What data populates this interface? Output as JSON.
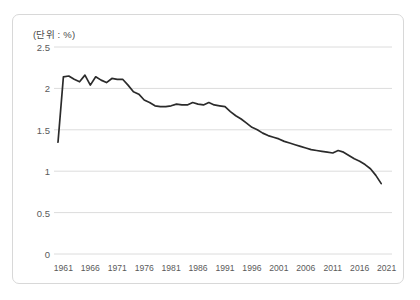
{
  "chart_data": {
    "type": "line",
    "title": "",
    "subtitle": "",
    "unit_label": "(단위 : %)",
    "xlabel": "",
    "ylabel": "",
    "xlim": [
      1960,
      2022
    ],
    "ylim": [
      0,
      2.5
    ],
    "grid": true,
    "legend_position": "none",
    "line_color": "#2b2b2b",
    "grid_color": "#dcdcdc",
    "frame_color": "#d8d8d8",
    "text_color": "#5a5a5a",
    "yticks": [
      "0",
      "0.5",
      "1",
      "1.5",
      "2",
      "2.5"
    ],
    "ytick_values": [
      0,
      0.5,
      1,
      1.5,
      2,
      2.5
    ],
    "xticks": [
      "1961",
      "1966",
      "1971",
      "1976",
      "1981",
      "1986",
      "1991",
      "1996",
      "2001",
      "2006",
      "2011",
      "2016",
      "2021"
    ],
    "xtick_values": [
      1961,
      1966,
      1971,
      1976,
      1981,
      1986,
      1991,
      1996,
      2001,
      2006,
      2011,
      2016,
      2021
    ],
    "x": [
      1960,
      1961,
      1962,
      1963,
      1964,
      1965,
      1966,
      1967,
      1968,
      1969,
      1970,
      1971,
      1972,
      1973,
      1974,
      1975,
      1976,
      1977,
      1978,
      1979,
      1980,
      1981,
      1982,
      1983,
      1984,
      1985,
      1986,
      1987,
      1988,
      1989,
      1990,
      1991,
      1992,
      1993,
      1994,
      1995,
      1996,
      1997,
      1998,
      1999,
      2000,
      2001,
      2002,
      2003,
      2004,
      2005,
      2006,
      2007,
      2008,
      2009,
      2010,
      2011,
      2012,
      2013,
      2014,
      2015,
      2016,
      2017,
      2018,
      2019,
      2020
    ],
    "values": [
      1.35,
      2.14,
      2.15,
      2.11,
      2.08,
      2.16,
      2.04,
      2.14,
      2.1,
      2.07,
      2.12,
      2.11,
      2.11,
      2.04,
      1.96,
      1.93,
      1.86,
      1.83,
      1.79,
      1.78,
      1.78,
      1.79,
      1.81,
      1.8,
      1.8,
      1.83,
      1.81,
      1.8,
      1.83,
      1.8,
      1.79,
      1.78,
      1.72,
      1.67,
      1.63,
      1.58,
      1.53,
      1.5,
      1.46,
      1.43,
      1.41,
      1.39,
      1.36,
      1.34,
      1.32,
      1.3,
      1.28,
      1.26,
      1.25,
      1.24,
      1.23,
      1.22,
      1.25,
      1.23,
      1.19,
      1.15,
      1.12,
      1.08,
      1.03,
      0.95,
      0.85
    ],
    "series": [
      {
        "name": "rate",
        "values": [
          1.35,
          2.14,
          2.15,
          2.11,
          2.08,
          2.16,
          2.04,
          2.14,
          2.1,
          2.07,
          2.12,
          2.11,
          2.11,
          2.04,
          1.96,
          1.93,
          1.86,
          1.83,
          1.79,
          1.78,
          1.78,
          1.79,
          1.81,
          1.8,
          1.8,
          1.83,
          1.81,
          1.8,
          1.83,
          1.8,
          1.79,
          1.78,
          1.72,
          1.67,
          1.63,
          1.58,
          1.53,
          1.5,
          1.46,
          1.43,
          1.41,
          1.39,
          1.36,
          1.34,
          1.32,
          1.3,
          1.28,
          1.26,
          1.25,
          1.24,
          1.23,
          1.22,
          1.25,
          1.23,
          1.19,
          1.15,
          1.12,
          1.08,
          1.03,
          0.95,
          0.85
        ]
      }
    ]
  }
}
